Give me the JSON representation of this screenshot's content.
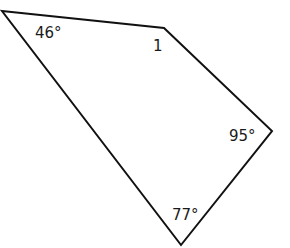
{
  "figure": {
    "type": "quadrilateral",
    "stroke_color": "#111111",
    "vertices": [
      [
        2,
        11
      ],
      [
        164,
        28
      ],
      [
        272,
        131
      ],
      [
        181,
        245
      ]
    ],
    "angles": {
      "top_left": "46°",
      "top_right": "1",
      "right": "95°",
      "bottom": "77°"
    }
  }
}
